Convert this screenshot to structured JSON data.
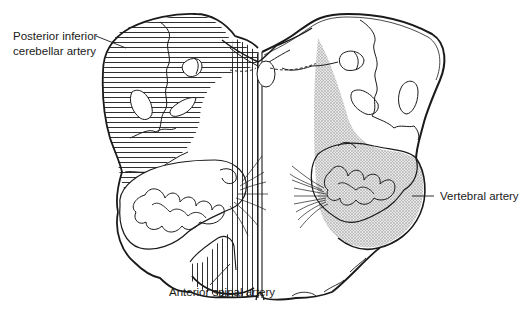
{
  "diagram": {
    "labels": {
      "pica_line1": "Posterior inferior",
      "pica_line2": "cerebellar artery",
      "vertebral": "Vertebral artery",
      "anterior_spinal": "Anterior spinal artery"
    },
    "territories": [
      {
        "name": "Posterior inferior cerebellar artery",
        "pattern": "horizontal-hatch",
        "side": "left-dorsolateral"
      },
      {
        "name": "Anterior spinal artery",
        "pattern": "vertical-hatch",
        "side": "paramedian"
      },
      {
        "name": "Vertebral artery",
        "pattern": "stipple",
        "side": "right-ventrolateral"
      }
    ],
    "colors": {
      "ink": "#1a1a1a",
      "stipple": "#cfcfcf",
      "background": "#ffffff"
    }
  }
}
